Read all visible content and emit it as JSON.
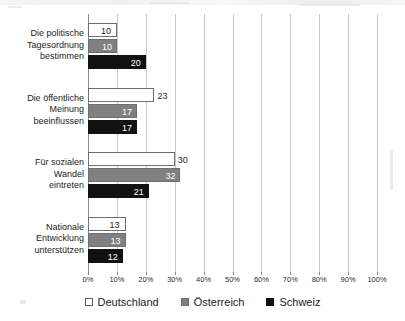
{
  "chart_data": {
    "type": "bar",
    "orientation": "horizontal",
    "title": "",
    "subtitle": "",
    "xlabel": "",
    "ylabel": "",
    "xlim": [
      0,
      100
    ],
    "xtick_step": 10,
    "grid": true,
    "legend_position": "bottom",
    "value_suffix": "",
    "categories": [
      "Die politische Tagesordnung bestimmen",
      "Die öffentliche Meinung beeinflussen",
      "Für sozialen Wandel eintreten",
      "Nationale Entwicklung unterstützen"
    ],
    "category_lines": [
      [
        "Die politische",
        "Tagesordnung",
        "bestimmen"
      ],
      [
        "Die öffentliche",
        "Meinung",
        "beeinflussen"
      ],
      [
        "Für sozialen",
        "Wandel",
        "eintreten"
      ],
      [
        "Nationale",
        "Entwicklung",
        "unterstützen"
      ]
    ],
    "tick_labels": [
      "0%",
      "10%",
      "20%",
      "30%",
      "40%",
      "50%",
      "60%",
      "70%",
      "80%",
      "90%",
      "100%"
    ],
    "tick_values": [
      0,
      10,
      20,
      30,
      40,
      50,
      60,
      70,
      80,
      90,
      100
    ],
    "series": [
      {
        "name": "Deutschland",
        "color": "#ffffff",
        "border": "#6d6d6d",
        "label_color": "#222222",
        "values": [
          10,
          23,
          30,
          13
        ]
      },
      {
        "name": "Österreich",
        "color": "#808080",
        "border": "#6f6f6f",
        "label_color": "#ffffff",
        "values": [
          10,
          17,
          32,
          13
        ]
      },
      {
        "name": "Schweiz",
        "color": "#111111",
        "border": "#111111",
        "label_color": "#ffffff",
        "values": [
          20,
          17,
          21,
          12
        ]
      }
    ],
    "legend": [
      {
        "label": "Deutschland",
        "swatch": "de"
      },
      {
        "label": "Österreich",
        "swatch": "at"
      },
      {
        "label": "Schweiz",
        "swatch": "ch"
      }
    ]
  }
}
